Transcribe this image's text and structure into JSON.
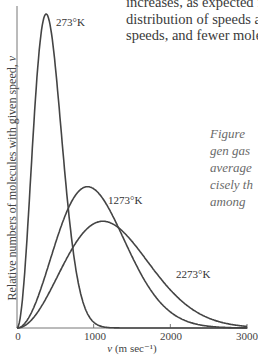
{
  "body_text": {
    "lines": [
      "increases, as expected fr",
      "distribution of speeds als",
      "speeds, and fewer molec"
    ]
  },
  "caption": {
    "lines": [
      "Figure",
      "gen gas",
      "average",
      "cisely th",
      "among"
    ]
  },
  "chart_data": {
    "type": "line",
    "title": "",
    "xlabel": "v (m sec⁻¹)",
    "xlabel_var": "v",
    "xlabel_unit": " (m sec⁻¹)",
    "ylabel": "Relative numbers of molecules with given speed, v",
    "ylabel_text": "Relative numbers of molecules with given speed, ",
    "ylabel_var": "v",
    "xlim": [
      0,
      3000
    ],
    "ylim": [
      0,
      1.0
    ],
    "xticks": [
      0,
      1000,
      2000,
      3000
    ],
    "xtick_labels": [
      "0",
      "1000",
      "2000",
      "3000"
    ],
    "grid": false,
    "legend": "none (curves labeled directly)",
    "series": [
      {
        "name": "273°K",
        "label": "273°K",
        "most_probable_speed": 380,
        "peak_relative": 1.0
      },
      {
        "name": "1273°K",
        "label": "1273°K",
        "most_probable_speed": 920,
        "peak_relative": 0.45
      },
      {
        "name": "2273°K",
        "label": "2273°K",
        "most_probable_speed": 1120,
        "peak_relative": 0.34
      }
    ],
    "sampled_points": {
      "x": [
        0,
        200,
        400,
        600,
        800,
        1000,
        1200,
        1400,
        1600,
        1800,
        2000,
        2400,
        2800,
        3000
      ],
      "273°K": [
        0,
        0.47,
        0.99,
        0.63,
        0.17,
        0.02,
        0.0,
        0.0,
        0.0,
        0.0,
        0.0,
        0.0,
        0.0,
        0.0
      ],
      "1273°K": [
        0,
        0.05,
        0.16,
        0.31,
        0.42,
        0.45,
        0.4,
        0.3,
        0.2,
        0.11,
        0.06,
        0.01,
        0.0,
        0.0
      ],
      "2273°K": [
        0,
        0.03,
        0.1,
        0.2,
        0.28,
        0.33,
        0.34,
        0.31,
        0.26,
        0.2,
        0.14,
        0.06,
        0.02,
        0.01
      ]
    }
  },
  "colors": {
    "curve": "#444444",
    "axis": "#777777",
    "text": "#3a3a3a",
    "caption": "#6a6a6a",
    "background": "#ffffff"
  }
}
